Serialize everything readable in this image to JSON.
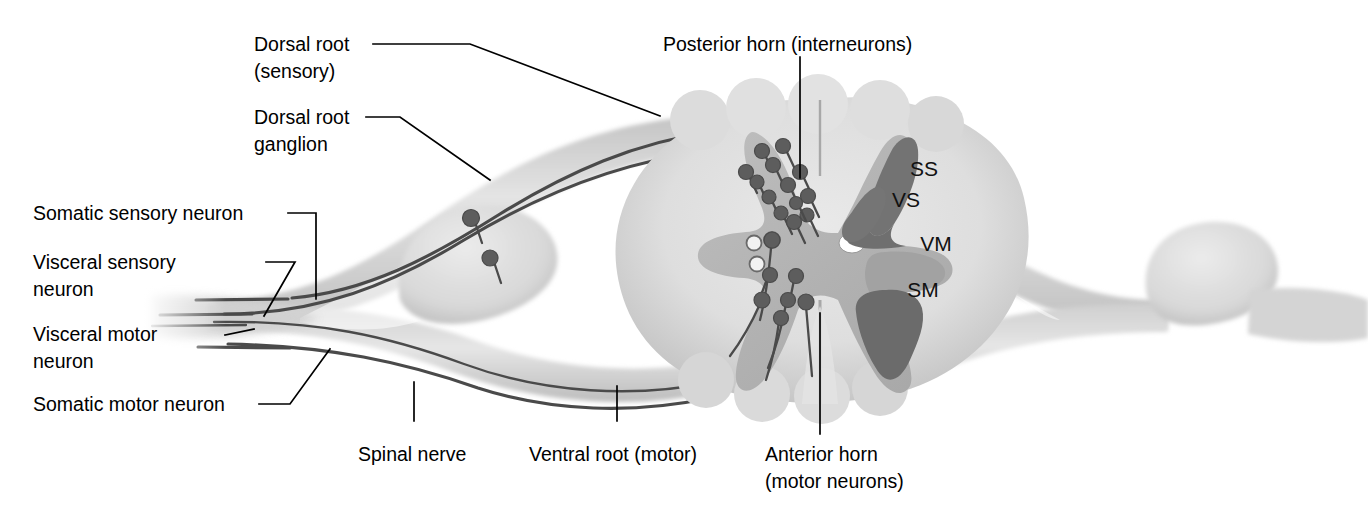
{
  "figure": {
    "background_color": "#ffffff"
  },
  "colors": {
    "white_matter": "#dcdcdc",
    "gray_matter": "#b4b4b4",
    "dark_horn": "#7a7a7a",
    "nerve_sheath": "#d2d2d2",
    "axon_line": "#4a4a4a",
    "soma_fill": "#5d5d5d",
    "soma_open_fill": "#f2f2f2",
    "leader_line": "#000000",
    "text": "#000000"
  },
  "labels": {
    "dorsal_root": {
      "line1": "Dorsal root",
      "line2": "(sensory)"
    },
    "dorsal_root_ganglion": {
      "line1": "Dorsal root",
      "line2": "ganglion"
    },
    "posterior_horn": {
      "line1": "Posterior horn (interneurons)"
    },
    "somatic_sensory_neuron": {
      "line1": "Somatic sensory neuron"
    },
    "visceral_sensory_neuron": {
      "line1": "Visceral sensory",
      "line2": "neuron"
    },
    "visceral_motor_neuron": {
      "line1": "Visceral motor",
      "line2": "neuron"
    },
    "somatic_motor_neuron": {
      "line1": "Somatic motor neuron"
    },
    "spinal_nerve": {
      "line1": "Spinal nerve"
    },
    "ventral_root": {
      "line1": "Ventral root (motor)"
    },
    "anterior_horn": {
      "line1": "Anterior horn",
      "line2": "(motor neurons)"
    }
  },
  "zones": [
    {
      "code": "SS",
      "name": "somatic-sensory-zone",
      "shade": "dark"
    },
    {
      "code": "VS",
      "name": "visceral-sensory-zone",
      "shade": "dark"
    },
    {
      "code": "VM",
      "name": "visceral-motor-zone",
      "shade": "medium"
    },
    {
      "code": "SM",
      "name": "somatic-motor-zone",
      "shade": "dark"
    }
  ],
  "anatomy": {
    "central_canal": "central-canal",
    "posterior_horn_neuron_count": 13,
    "anterior_horn_dark_neuron_count": 7,
    "anterior_horn_open_neuron_count": 3,
    "ganglion_neuron_count": 2,
    "nerve_fiber_count": 4
  }
}
